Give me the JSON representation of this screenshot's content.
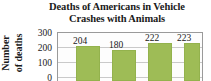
{
  "chart_data": {
    "type": "bar",
    "title": "Deaths of Americans in Vehicle Crashes with Animals",
    "title_line1": "Deaths of Americans in Vehicle",
    "title_line2": "Crashes with Animals",
    "xlabel": "",
    "ylabel": "Number of deaths",
    "ylabel_line1": "Number",
    "ylabel_line2": "of deaths",
    "categories": [
      "",
      "",
      "",
      ""
    ],
    "values": [
      204,
      180,
      222,
      223
    ],
    "data_labels": [
      "204",
      "180",
      "222",
      "223"
    ],
    "ylim": [
      0,
      300
    ],
    "yticks": [
      300,
      200,
      100,
      0
    ],
    "ytick_labels": [
      "300",
      "200",
      "100",
      "0"
    ],
    "grid": true,
    "legend": false,
    "bar_color": "#9ebc56",
    "bar_border_color": "#93b24d",
    "gridline_color": "#c9c9c9",
    "axis_color": "#9a9a9a",
    "text_color": "#1a1a1a",
    "plot_background": "#fdfdfd"
  }
}
